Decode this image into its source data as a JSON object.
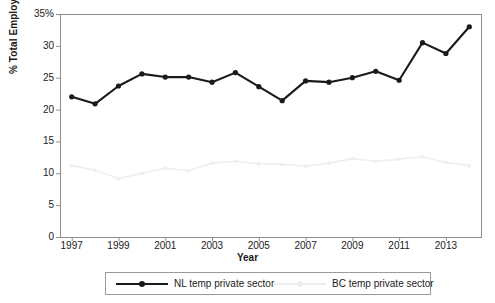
{
  "chart_data": {
    "type": "line",
    "title": "",
    "subtitle": "",
    "xlabel": "Year",
    "ylabel": "% Total Employed",
    "x": [
      1997,
      1998,
      1999,
      2000,
      2001,
      2002,
      2003,
      2004,
      2005,
      2006,
      2007,
      2008,
      2009,
      2010,
      2011,
      2012,
      2013,
      2014
    ],
    "xlim": [
      1996.5,
      2014.5
    ],
    "ylim": [
      0,
      35
    ],
    "grid": false,
    "legend_position": "bottom",
    "yticks": [
      0,
      5,
      10,
      15,
      20,
      25,
      30,
      35
    ],
    "ytick_labels": [
      "0",
      "5",
      "10",
      "15",
      "20",
      "25",
      "30",
      "35%"
    ],
    "xticks": [
      1997,
      1999,
      2001,
      2003,
      2005,
      2007,
      2009,
      2011,
      2013
    ],
    "xtick_labels": [
      "1997",
      "1999",
      "2001",
      "2003",
      "2005",
      "2007",
      "2009",
      "2011",
      "2013"
    ],
    "series": [
      {
        "name": "NL temp private sector",
        "color": "#1a1a1a",
        "marker": "circle",
        "values": [
          22.0,
          20.9,
          23.7,
          25.6,
          25.1,
          25.1,
          24.3,
          25.8,
          23.6,
          21.4,
          24.5,
          24.3,
          25.0,
          26.0,
          24.6,
          30.5,
          28.8,
          33.0
        ]
      },
      {
        "name": "BC temp private sector",
        "color": "#eeeeee",
        "marker": "circle",
        "values": [
          11.2,
          10.5,
          9.2,
          10.0,
          10.8,
          10.4,
          11.6,
          11.9,
          11.5,
          11.4,
          11.1,
          11.6,
          12.3,
          11.9,
          12.2,
          12.6,
          11.7,
          11.2
        ]
      }
    ]
  },
  "legend": {
    "items": [
      {
        "label": "NL temp private sector",
        "color": "#1a1a1a"
      },
      {
        "label": "BC temp private sector",
        "color": "#eeeeee"
      }
    ]
  },
  "axes": {
    "frame_color": "#8f8f8f"
  }
}
